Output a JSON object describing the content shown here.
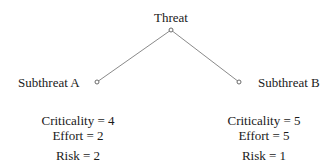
{
  "diagram": {
    "type": "attack-tree",
    "root": {
      "label": "Threat"
    },
    "children": [
      {
        "label": "Subthreat A",
        "metrics": {
          "criticality": "Criticality = 4",
          "effort": "Effort = 2",
          "risk": "Risk = 2"
        }
      },
      {
        "label": "Subthreat B",
        "metrics": {
          "criticality": "Criticality = 5",
          "effort": "Effort = 5",
          "risk": "Risk = 1"
        }
      }
    ],
    "colors": {
      "edge": "#8a8a8a",
      "text": "#1a1a1a",
      "background": "#ffffff"
    }
  }
}
